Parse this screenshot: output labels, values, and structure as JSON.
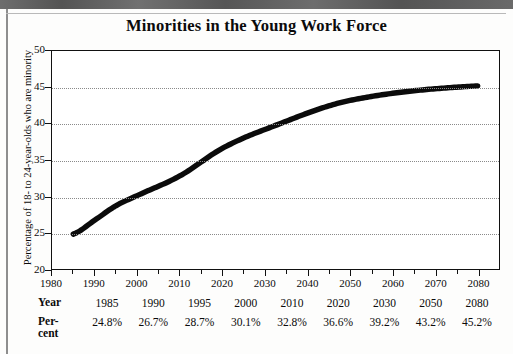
{
  "chart_data": {
    "type": "line",
    "title": "Minorities in the Young Work Force",
    "xlabel": "",
    "ylabel": "Percentage of 18- to 24-year-olds who are minority",
    "xlim": [
      1980,
      2085
    ],
    "ylim": [
      20,
      50
    ],
    "grid": true,
    "legend": "none",
    "x_ticks": [
      1980,
      1990,
      2000,
      2010,
      2020,
      2030,
      2040,
      2050,
      2060,
      2070,
      2080
    ],
    "x_minor_ticks": [
      1985,
      1995,
      2005,
      2015,
      2025,
      2035,
      2045,
      2055,
      2065,
      2075
    ],
    "y_ticks": [
      20,
      25,
      30,
      35,
      40,
      45,
      50
    ],
    "series": [
      {
        "name": "Percentage minority",
        "x": [
          1985,
          1990,
          1995,
          2000,
          2010,
          2020,
          2030,
          2050,
          2080
        ],
        "values": [
          24.8,
          26.7,
          28.7,
          30.1,
          32.8,
          36.6,
          39.2,
          43.2,
          45.2
        ]
      }
    ]
  },
  "table": {
    "row_labels": {
      "year": "Year",
      "percent_line1": "Per-",
      "percent_line2": "cent"
    },
    "years": [
      "1985",
      "1990",
      "1995",
      "2000",
      "2010",
      "2020",
      "2030",
      "2050",
      "2080"
    ],
    "percents": [
      "24.8%",
      "26.7%",
      "28.7%",
      "30.1%",
      "32.8%",
      "36.6%",
      "39.2%",
      "43.2%",
      "45.2%"
    ]
  },
  "axes": {
    "y_labels": [
      "50",
      "45",
      "40",
      "35",
      "30",
      "25",
      "20"
    ],
    "x_labels": [
      "1980",
      "1990",
      "2000",
      "2010",
      "2020",
      "2030",
      "2040",
      "2050",
      "2060",
      "2070",
      "2080"
    ],
    "y_title": "Percentage of 18- to 24-year-olds who are minority"
  },
  "colors": {
    "line": "#0b0b0b",
    "grid": "#8a8a8a",
    "frame": "#111111",
    "page": "#ffffff",
    "scan_band": "#5d5d5d"
  }
}
